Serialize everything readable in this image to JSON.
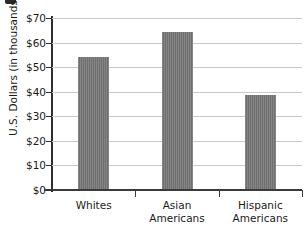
{
  "chart_data": {
    "type": "bar",
    "title": "",
    "xlabel": "",
    "ylabel": "U.S. Dollars (in thousands)",
    "categories": [
      "Whites",
      "Asian Americans",
      "Hispanic Americans"
    ],
    "category_lines": [
      [
        "Whites"
      ],
      [
        "Asian",
        "Americans"
      ],
      [
        "Hispanic",
        "Americans"
      ]
    ],
    "values": [
      54.3,
      64.2,
      38.5
    ],
    "ylim": [
      0,
      70
    ],
    "ytick_values": [
      70,
      60,
      50,
      40,
      30,
      20,
      10,
      0
    ],
    "ytick_labels": [
      "$70",
      "$60",
      "$50",
      "$40",
      "$30",
      "$20",
      "$10",
      "$0"
    ],
    "grid": "horizontal",
    "legend": "none",
    "bar_color": "#767676",
    "gridline_color": "#c9c9c9",
    "axis_color": "#2e2e2e"
  }
}
